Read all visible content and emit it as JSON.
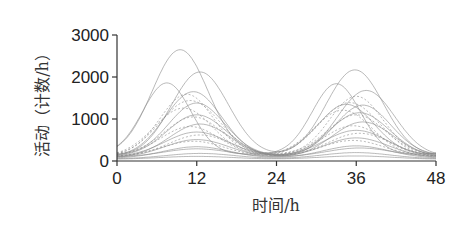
{
  "chart_data": {
    "type": "line",
    "title": "",
    "xlabel": "时间/h",
    "ylabel": "活动（计数/h）",
    "xlim": [
      0,
      48
    ],
    "ylim": [
      0,
      3000
    ],
    "x_ticks": [
      0,
      12,
      24,
      36,
      48
    ],
    "y_ticks": [
      0,
      1000,
      2000,
      3000
    ],
    "x_tick_labels": [
      "0",
      "12",
      "24",
      "36",
      "48"
    ],
    "y_tick_labels": [
      "0",
      "1000",
      "2000",
      "3000"
    ],
    "grid": false,
    "legend": null,
    "series_model": "y = base + a1*exp(-((x-m1)^2)/(2*s^2)) + a2*exp(-((x-m2)^2)/(2*s^2))",
    "series": [
      {
        "name": "s1",
        "base": 150,
        "a1": 2500,
        "m1": 9.5,
        "a2": 1200,
        "m2": 34.5,
        "s": 4.2,
        "dash": false
      },
      {
        "name": "s2",
        "base": 120,
        "a1": 2000,
        "m1": 12.5,
        "a2": 2050,
        "m2": 35.8,
        "s": 4.3,
        "dash": false
      },
      {
        "name": "s3",
        "base": 160,
        "a1": 1700,
        "m1": 7.5,
        "a2": 1680,
        "m2": 33.0,
        "s": 3.6,
        "dash": false
      },
      {
        "name": "s4",
        "base": 100,
        "a1": 1550,
        "m1": 11.5,
        "a2": 1580,
        "m2": 37.5,
        "s": 4.3,
        "dash": false
      },
      {
        "name": "s5",
        "base": 140,
        "a1": 1450,
        "m1": 10.5,
        "a2": 1400,
        "m2": 36.0,
        "s": 4.0,
        "dash": true
      },
      {
        "name": "s6",
        "base": 90,
        "a1": 1350,
        "m1": 11.0,
        "a2": 1300,
        "m2": 35.0,
        "s": 4.6,
        "dash": true
      },
      {
        "name": "s7",
        "base": 130,
        "a1": 1250,
        "m1": 12.0,
        "a2": 1200,
        "m2": 37.0,
        "s": 4.2,
        "dash": false
      },
      {
        "name": "s8",
        "base": 110,
        "a1": 1150,
        "m1": 10.0,
        "a2": 1100,
        "m2": 34.0,
        "s": 4.4,
        "dash": true
      },
      {
        "name": "s9",
        "base": 100,
        "a1": 1000,
        "m1": 12.0,
        "a2": 1050,
        "m2": 36.5,
        "s": 4.5,
        "dash": false
      },
      {
        "name": "s10",
        "base": 150,
        "a1": 900,
        "m1": 11.5,
        "a2": 950,
        "m2": 36.0,
        "s": 4.3,
        "dash": true
      },
      {
        "name": "s11",
        "base": 80,
        "a1": 800,
        "m1": 12.5,
        "a2": 850,
        "m2": 37.0,
        "s": 4.6,
        "dash": false
      },
      {
        "name": "s12",
        "base": 120,
        "a1": 700,
        "m1": 11.0,
        "a2": 720,
        "m2": 35.5,
        "s": 4.4,
        "dash": true
      },
      {
        "name": "s13",
        "base": 90,
        "a1": 600,
        "m1": 12.0,
        "a2": 640,
        "m2": 36.0,
        "s": 4.8,
        "dash": false
      },
      {
        "name": "s14",
        "base": 100,
        "a1": 520,
        "m1": 12.5,
        "a2": 560,
        "m2": 36.5,
        "s": 4.7,
        "dash": true
      },
      {
        "name": "s15",
        "base": 70,
        "a1": 440,
        "m1": 12.0,
        "a2": 480,
        "m2": 36.0,
        "s": 4.9,
        "dash": false
      },
      {
        "name": "s16",
        "base": 110,
        "a1": 360,
        "m1": 11.5,
        "a2": 380,
        "m2": 35.5,
        "s": 4.6,
        "dash": true
      },
      {
        "name": "s17",
        "base": 60,
        "a1": 280,
        "m1": 12.0,
        "a2": 300,
        "m2": 36.0,
        "s": 5.0,
        "dash": false
      },
      {
        "name": "s18",
        "base": 90,
        "a1": 200,
        "m1": 12.0,
        "a2": 220,
        "m2": 36.5,
        "s": 5.0,
        "dash": false
      },
      {
        "name": "s19",
        "base": 50,
        "a1": 130,
        "m1": 12.5,
        "a2": 150,
        "m2": 36.0,
        "s": 5.2,
        "dash": false
      },
      {
        "name": "s20",
        "base": 40,
        "a1": 70,
        "m1": 12.0,
        "a2": 80,
        "m2": 36.0,
        "s": 5.5,
        "dash": false
      }
    ],
    "peak_estimates": {
      "day1_max": {
        "x": 9.5,
        "y": 2650
      },
      "day2_max": {
        "x": 35.7,
        "y": 2170
      }
    }
  },
  "style": {
    "line_color": "#8a8a8a",
    "axis_color": "#333333",
    "text_color": "#222222"
  },
  "layout": {
    "plot_left": 117,
    "plot_right": 436,
    "plot_top": 35,
    "plot_bottom": 161
  }
}
